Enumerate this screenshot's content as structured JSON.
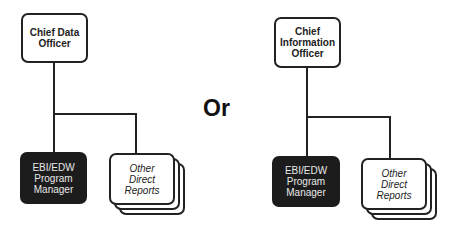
{
  "left_chart": {
    "top": {
      "lines": [
        "Chief Data",
        "Officer"
      ]
    },
    "child_primary": {
      "lines": [
        "EBI/EDW",
        "Program",
        "Manager"
      ]
    },
    "child_other": {
      "lines": [
        "Other",
        "Direct",
        "Reports"
      ]
    }
  },
  "separator": {
    "label": "Or"
  },
  "right_chart": {
    "top": {
      "lines": [
        "Chief",
        "Information",
        "Officer"
      ]
    },
    "child_primary": {
      "lines": [
        "EBI/EDW",
        "Program",
        "Manager"
      ]
    },
    "child_other": {
      "lines": [
        "Other",
        "Direct",
        "Reports"
      ]
    }
  },
  "colors": {
    "line": "#222222",
    "dark_box": "#1c1c1c",
    "dark_text": "#e8e8e8"
  }
}
